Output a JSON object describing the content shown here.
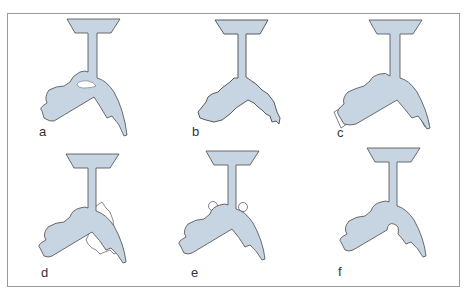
{
  "figure": {
    "colors": {
      "fill": "#c7d4e1",
      "stroke": "#4a4a4a",
      "defect_fill": "#ffffff",
      "frame": "#9a9a9a"
    },
    "panels": [
      {
        "label": "a",
        "defect": "white-inclusion-near-junction"
      },
      {
        "label": "b",
        "defect": "ragged-eroded-edges"
      },
      {
        "label": "c",
        "defect": "flash-at-arm-tips"
      },
      {
        "label": "d",
        "defect": "excess-material-under-right-arm"
      },
      {
        "label": "e",
        "defect": "small-round-blobs"
      },
      {
        "label": "f",
        "defect": "semicircular-notch-in-crotch"
      }
    ]
  }
}
